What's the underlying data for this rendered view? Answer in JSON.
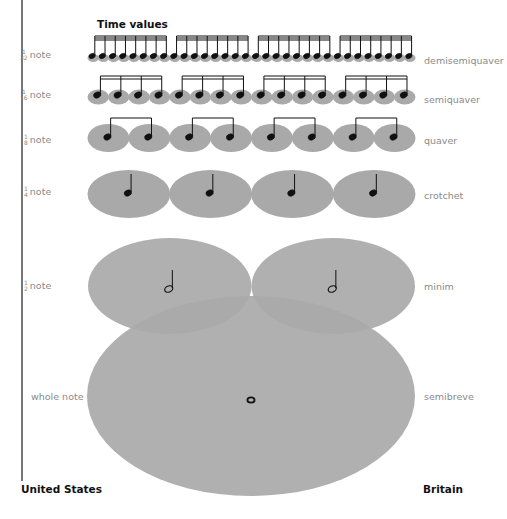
{
  "title": "Time values",
  "countries": {
    "left": "United States",
    "right": "Britain"
  },
  "rows": [
    {
      "id": "demisemiquaver",
      "us_fraction": {
        "num": "1",
        "den": "32"
      },
      "us_suffix": "note",
      "british_name": "demisemiquaver",
      "count": 32,
      "group_size": 8,
      "beams": 3
    },
    {
      "id": "semiquaver",
      "us_fraction": {
        "num": "1",
        "den": "16"
      },
      "us_suffix": "note",
      "british_name": "semiquaver",
      "count": 16,
      "group_size": 4,
      "beams": 2
    },
    {
      "id": "quaver",
      "us_fraction": {
        "num": "1",
        "den": "8"
      },
      "us_suffix": "note",
      "british_name": "quaver",
      "count": 8,
      "group_size": 2,
      "beams": 1
    },
    {
      "id": "crotchet",
      "us_fraction": {
        "num": "1",
        "den": "4"
      },
      "us_suffix": "note",
      "british_name": "crotchet",
      "count": 4,
      "group_size": 1,
      "beams": 0
    },
    {
      "id": "minim",
      "us_fraction": {
        "num": "1",
        "den": "2"
      },
      "us_suffix": "note",
      "british_name": "minim",
      "count": 2,
      "group_size": 1,
      "beams": 0
    },
    {
      "id": "semibreve",
      "us_label": "whole note",
      "british_name": "semibreve",
      "count": 1
    }
  ],
  "colors": {
    "ellipse_fill": "#a9a9a9",
    "note_ink": "#111111",
    "label_gray": "#8a8a8a",
    "divider": "#777777"
  }
}
